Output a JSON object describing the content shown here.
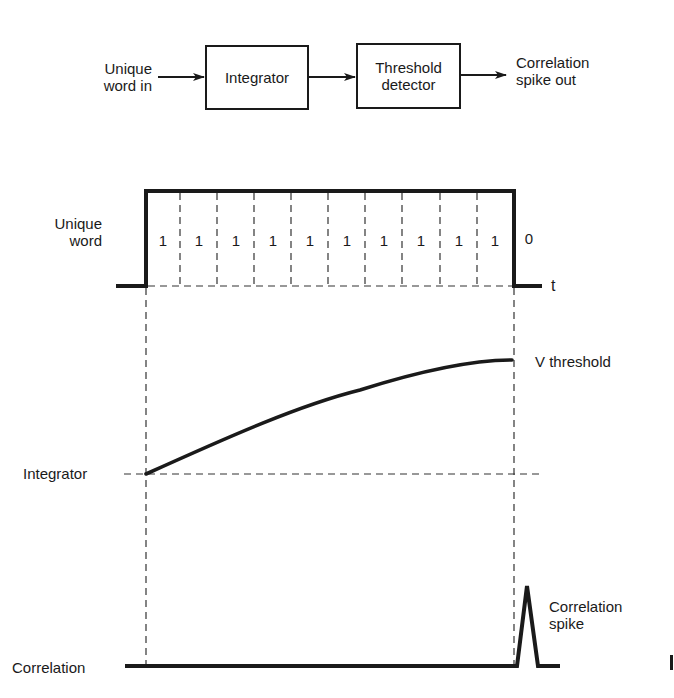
{
  "block_diagram": {
    "input_label_line1": "Unique",
    "input_label_line2": "word in",
    "blocks": [
      {
        "label_line1": "Integrator",
        "label_line2": ""
      },
      {
        "label_line1": "Threshold",
        "label_line2": "detector"
      }
    ],
    "output_label_line1": "Correlation",
    "output_label_line2": "spike out"
  },
  "timing": {
    "unique_word_label_line1": "Unique",
    "unique_word_label_line2": "word",
    "bits": [
      "1",
      "1",
      "1",
      "1",
      "1",
      "1",
      "1",
      "1",
      "1",
      "1"
    ],
    "trailing_bit": "0",
    "time_axis_label": "t",
    "integrator_label": "Integrator",
    "threshold_label": "V threshold",
    "correlation_label": "Correlation",
    "spike_label_line1": "Correlation",
    "spike_label_line2": "spike"
  },
  "colors": {
    "ink": "#1a1a1a",
    "background": "#ffffff"
  }
}
